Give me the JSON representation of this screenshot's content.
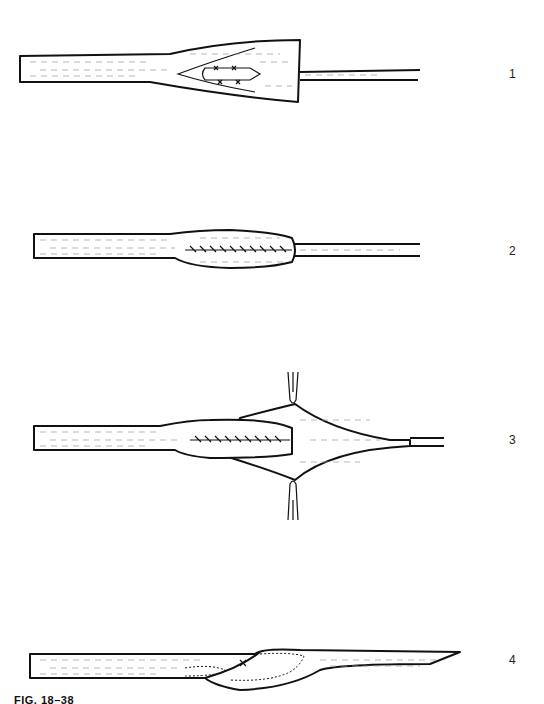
{
  "figure": {
    "caption": "FIG. 18–38",
    "colors": {
      "ink": "#111111",
      "paper": "#ffffff"
    },
    "panels": [
      {
        "id": 1,
        "label": "1",
        "description": "Tapered tendon end split with sutured graft inserted into wedge"
      },
      {
        "id": 2,
        "label": "2",
        "description": "Tubularized repair with continuous suture line"
      },
      {
        "id": 3,
        "label": "3",
        "description": "Tendon sheath spread by two forceps over sutured repair"
      },
      {
        "id": 4,
        "label": "4",
        "description": "Oblique overlap repair with dotted inner outline"
      }
    ]
  }
}
